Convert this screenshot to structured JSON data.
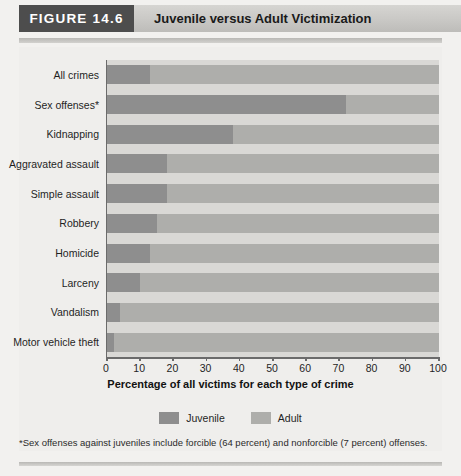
{
  "header": {
    "figure_tag": "FIGURE 14.6",
    "title": "Juvenile versus Adult Victimization"
  },
  "footnote": "*Sex offenses against juveniles include forcible (64 percent) and nonforcible (7 percent) offenses.",
  "legend": {
    "items": [
      {
        "label": "Juvenile",
        "color": "#8e8e8e",
        "name": "legend-juvenile"
      },
      {
        "label": "Adult",
        "color": "#aeaeab",
        "name": "legend-adult"
      }
    ]
  },
  "chart_data": {
    "type": "bar",
    "orientation": "horizontal",
    "stacked": true,
    "title": "Juvenile versus Adult Victimization",
    "xlabel": "Percentage of all victims for each type of crime",
    "ylabel": "",
    "xlim": [
      0,
      100
    ],
    "xticks": [
      0,
      10,
      20,
      30,
      40,
      50,
      60,
      70,
      80,
      90,
      100
    ],
    "xtick_labels": [
      "0",
      "10",
      "20",
      "30",
      "40",
      "50",
      "60",
      "70",
      "80",
      "90",
      "100"
    ],
    "grid": false,
    "legend_position": "bottom-center",
    "categories": [
      "All crimes",
      "Sex offenses*",
      "Kidnapping",
      "Aggravated assault",
      "Simple assault",
      "Robbery",
      "Homicide",
      "Larceny",
      "Vandalism",
      "Motor vehicle theft"
    ],
    "series": [
      {
        "name": "Juvenile",
        "color": "#8e8e8e",
        "values": [
          13,
          72,
          38,
          18,
          18,
          15,
          13,
          10,
          4,
          2
        ]
      },
      {
        "name": "Adult",
        "color": "#aeaeab",
        "values": [
          87,
          28,
          62,
          82,
          82,
          85,
          87,
          90,
          96,
          98
        ]
      }
    ]
  }
}
